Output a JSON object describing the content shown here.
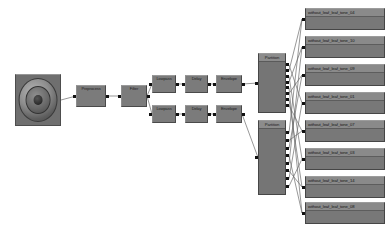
{
  "diagram": {
    "background_color": "#ffffff",
    "node_fill_color": "#7b7b7b",
    "node_border_color": "#464646",
    "wire_color": "#6b6b6b",
    "port_color": "#111111"
  },
  "source": {
    "name": "Loudspeaker",
    "icon": "speaker-icon",
    "x": 15,
    "y": 74,
    "w": 46,
    "h": 52
  },
  "chain": [
    {
      "label": "Preprocess",
      "x": 76,
      "y": 85,
      "w": 30,
      "h": 22
    },
    {
      "label": "Filter",
      "x": 121,
      "y": 85,
      "w": 26,
      "h": 22
    }
  ],
  "branches": [
    {
      "name": "upper-branch",
      "nodes": [
        {
          "label": "Lowpass",
          "x": 152,
          "y": 75,
          "w": 24,
          "h": 18
        },
        {
          "label": "Delay",
          "x": 185,
          "y": 75,
          "w": 23,
          "h": 18
        },
        {
          "label": "Envelope",
          "x": 216,
          "y": 75,
          "w": 26,
          "h": 18
        }
      ]
    },
    {
      "name": "lower-branch",
      "nodes": [
        {
          "label": "Lowpass",
          "x": 152,
          "y": 105,
          "w": 24,
          "h": 18
        },
        {
          "label": "Delay",
          "x": 185,
          "y": 105,
          "w": 23,
          "h": 18
        },
        {
          "label": "Envelope",
          "x": 216,
          "y": 105,
          "w": 26,
          "h": 18
        }
      ]
    }
  ],
  "fanouts": [
    {
      "label": "Partition",
      "x": 258,
      "y": 53,
      "w": 28,
      "h": 60,
      "ports": 8
    },
    {
      "label": "Partition",
      "x": 258,
      "y": 120,
      "w": 28,
      "h": 75,
      "ports": 8
    }
  ],
  "sinks": [
    {
      "label": "without_leaf_leaf_tone_04",
      "x": 305,
      "y": 8,
      "w": 80,
      "h": 22
    },
    {
      "label": "without_leaf_leaf_tone_10",
      "x": 305,
      "y": 36,
      "w": 80,
      "h": 22
    },
    {
      "label": "without_leaf_leaf_tone_09",
      "x": 305,
      "y": 64,
      "w": 80,
      "h": 22
    },
    {
      "label": "without_leaf_leaf_tone_01",
      "x": 305,
      "y": 92,
      "w": 80,
      "h": 22
    },
    {
      "label": "without_leaf_leaf_tone_07",
      "x": 305,
      "y": 120,
      "w": 80,
      "h": 22
    },
    {
      "label": "without_leaf_leaf_tone_03",
      "x": 305,
      "y": 148,
      "w": 80,
      "h": 22
    },
    {
      "label": "without_leaf_leaf_tone_14",
      "x": 305,
      "y": 176,
      "w": 80,
      "h": 22
    },
    {
      "label": "without_leaf_leaf_tone_08",
      "x": 305,
      "y": 202,
      "w": 80,
      "h": 22
    }
  ]
}
